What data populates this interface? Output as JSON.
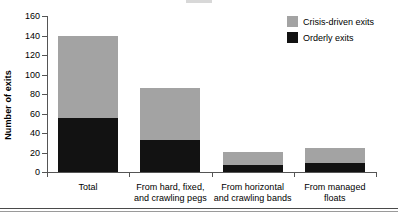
{
  "chart_data": {
    "type": "bar",
    "subtype": "stacked-vertical",
    "title": "",
    "xlabel": "",
    "ylabel": "Number of exits",
    "ylim": [
      0,
      160
    ],
    "yticks": [
      0,
      20,
      40,
      60,
      80,
      100,
      120,
      140,
      160
    ],
    "ytick_labels": [
      "0",
      "20",
      "40",
      "60",
      "80",
      "100",
      "120",
      "140",
      "160"
    ],
    "grid": false,
    "legend_position": "top-right",
    "categories": [
      "Total",
      "From hard, fixed,\nand crawling pegs",
      "From horizontal\nand crawling bands",
      "From managed\nfloats"
    ],
    "category_lines": [
      [
        "Total"
      ],
      [
        "From hard, fixed,",
        "and crawling pegs"
      ],
      [
        "From horizontal",
        "and crawling bands"
      ],
      [
        "From managed",
        "floats"
      ]
    ],
    "series": [
      {
        "name": "Orderly exits",
        "color": "#121212",
        "values": [
          55,
          33,
          7,
          9
        ]
      },
      {
        "name": "Crisis-driven exits",
        "color": "#a3a3a3",
        "values": [
          84,
          53,
          14,
          16
        ]
      }
    ],
    "totals": [
      139,
      86,
      21,
      25
    ],
    "stack_order": [
      "Orderly exits",
      "Crisis-driven exits"
    ]
  },
  "legend": {
    "entries": [
      {
        "label": "Crisis-driven exits",
        "color": "#a3a3a3"
      },
      {
        "label": "Orderly exits",
        "color": "#121212"
      }
    ]
  },
  "axis": {
    "y_title": "Number of exits"
  }
}
